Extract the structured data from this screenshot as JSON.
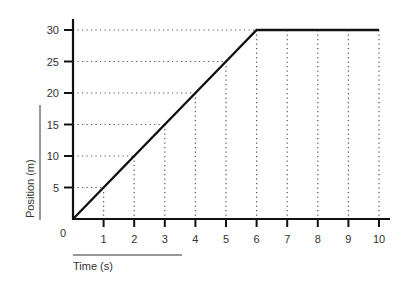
{
  "chart_data": {
    "type": "line",
    "title": "",
    "xlabel": "Time (s)",
    "ylabel": "Position (m)",
    "x": [
      0,
      1,
      2,
      3,
      4,
      5,
      6,
      7,
      8,
      9,
      10
    ],
    "series": [
      {
        "name": "Position",
        "values": [
          0,
          5,
          10,
          15,
          20,
          25,
          30,
          30,
          30,
          30,
          30
        ]
      }
    ],
    "xlim": [
      0,
      10
    ],
    "ylim": [
      0,
      30
    ],
    "x_ticks": [
      1,
      2,
      3,
      4,
      5,
      6,
      7,
      8,
      9,
      10
    ],
    "y_ticks": [
      5,
      10,
      15,
      20,
      25,
      30
    ],
    "origin_label": "0",
    "grid": "dotted drop-lines from data points to axes",
    "colors": {
      "line": "#111111",
      "axis": "#111111",
      "grid": "#555555",
      "text": "#333333"
    }
  }
}
